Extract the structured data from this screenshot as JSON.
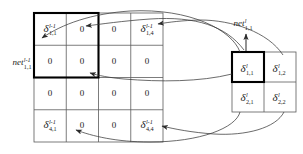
{
  "figure": {
    "background_color": "#ffffff",
    "line_color": "#3a3a3a",
    "bold_line_color": "#000000",
    "text_color": "#1a1a1a"
  },
  "left_grid": {
    "name": "layer-l-minus-1-delta-grid",
    "rows": 4,
    "cols": 4,
    "highlight_region": "top-left 2x2 block outlined in bold",
    "cells": [
      [
        {
          "sym": "δ",
          "sup": "l-1",
          "sub": "1,1",
          "value": null
        },
        {
          "sym": null,
          "sup": null,
          "sub": null,
          "value": "0"
        },
        {
          "sym": null,
          "sup": null,
          "sub": null,
          "value": "0"
        },
        {
          "sym": "δ",
          "sup": "l-1",
          "sub": "1,4",
          "value": null
        }
      ],
      [
        {
          "sym": null,
          "sup": null,
          "sub": null,
          "value": "0"
        },
        {
          "sym": null,
          "sup": null,
          "sub": null,
          "value": "0"
        },
        {
          "sym": null,
          "sup": null,
          "sub": null,
          "value": "0"
        },
        {
          "sym": null,
          "sup": null,
          "sub": null,
          "value": "0"
        }
      ],
      [
        {
          "sym": null,
          "sup": null,
          "sub": null,
          "value": "0"
        },
        {
          "sym": null,
          "sup": null,
          "sub": null,
          "value": "0"
        },
        {
          "sym": null,
          "sup": null,
          "sub": null,
          "value": "0"
        },
        {
          "sym": null,
          "sup": null,
          "sub": null,
          "value": "0"
        }
      ],
      [
        {
          "sym": "δ",
          "sup": "l-1",
          "sub": "4,1",
          "value": null
        },
        {
          "sym": null,
          "sup": null,
          "sub": null,
          "value": "0"
        },
        {
          "sym": null,
          "sup": null,
          "sub": null,
          "value": "0"
        },
        {
          "sym": "δ",
          "sup": "l-1",
          "sub": "4,4",
          "value": null
        }
      ]
    ]
  },
  "right_grid": {
    "name": "layer-l-delta-grid",
    "rows": 2,
    "cols": 2,
    "highlight_region": "cell 1,1 outlined in bold",
    "cells": [
      [
        {
          "sym": "δ",
          "sup": "l",
          "sub": "1,1"
        },
        {
          "sym": "δ",
          "sup": "l",
          "sub": "1,2"
        }
      ],
      [
        {
          "sym": "δ",
          "sup": "l",
          "sub": "2,1"
        },
        {
          "sym": "δ",
          "sup": "l",
          "sub": "2,2"
        }
      ]
    ]
  },
  "labels": {
    "net_left": {
      "word": "net",
      "sup": "l-1",
      "sub": "1,1"
    },
    "net_right": {
      "word": "net",
      "sup": "l",
      "sub": "1,1"
    }
  },
  "connectors": [
    {
      "from": "delta-l-1-1",
      "to": "net-l-1-1-1",
      "style": "arrow-curve"
    },
    {
      "from": "delta-l-1-1",
      "to": "delta-l-1-1-1",
      "style": "arrow-curve"
    },
    {
      "from": "delta-l-1-2",
      "to": "delta-l-1-1-4",
      "style": "arrow-curve"
    },
    {
      "from": "delta-l-1-1",
      "to": "left-grid-cell-2-2",
      "style": "arrow-curve"
    },
    {
      "from": "delta-l-2-1",
      "to": "delta-l-1-4-1",
      "style": "arrow-curve"
    },
    {
      "from": "delta-l-2-2",
      "to": "delta-l-1-4-4",
      "style": "arrow-curve"
    },
    {
      "from": "delta-l-1-1-cell",
      "to": "net-l-1-1",
      "style": "straight-arrow-up"
    }
  ]
}
